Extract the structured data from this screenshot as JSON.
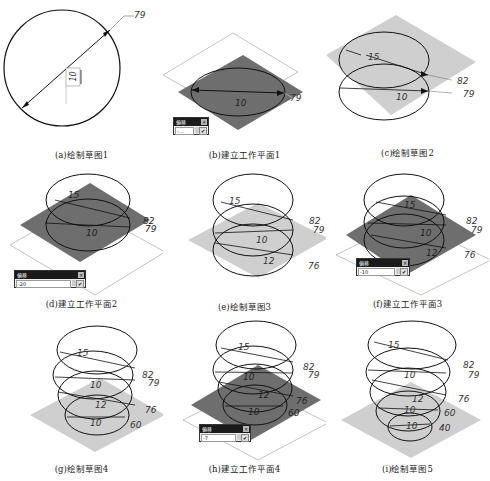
{
  "figure": {
    "panels": [
      {
        "id": "a",
        "caption": "(a)绘制草图1",
        "dims": [
          "79",
          "10"
        ]
      },
      {
        "id": "b",
        "caption": "(b)建立工作平面1",
        "dims": [
          "79",
          "10"
        ],
        "dialog": {
          "title": "偏移",
          "value": "-…"
        }
      },
      {
        "id": "c",
        "caption": "(c)绘制草图2",
        "dims": [
          "15",
          "82",
          "79",
          "10"
        ]
      },
      {
        "id": "d",
        "caption": "(d)建立工作平面2",
        "dims": [
          "15",
          "82",
          "79",
          "10"
        ],
        "dialog": {
          "title": "偏移",
          "value": "-20"
        }
      },
      {
        "id": "e",
        "caption": "(e)绘制草图3",
        "dims": [
          "15",
          "82",
          "79",
          "10",
          "12",
          "76"
        ]
      },
      {
        "id": "f",
        "caption": "(f)建立工作平面3",
        "dims": [
          "15",
          "82",
          "79",
          "10",
          "12",
          "76"
        ],
        "dialog": {
          "title": "偏移",
          "value": "-10"
        }
      },
      {
        "id": "g",
        "caption": "(g)绘制草图4",
        "dims": [
          "15",
          "82",
          "79",
          "10",
          "12",
          "76",
          "10",
          "60"
        ]
      },
      {
        "id": "h",
        "caption": "(h)建立工作平面4",
        "dims": [
          "15",
          "82",
          "79",
          "10",
          "12",
          "76",
          "10",
          "60"
        ],
        "dialog": {
          "title": "偏移",
          "value": "-7"
        }
      },
      {
        "id": "i",
        "caption": "(i)绘制草图5",
        "dims": [
          "15",
          "82",
          "79",
          "10",
          "12",
          "76",
          "10",
          "60",
          "10",
          "40"
        ]
      }
    ],
    "colors": {
      "plane_dark": "#6e6e6e",
      "plane_light": "#cfcfcf",
      "line": "#111111",
      "dialog_title": "#1a1a1a"
    },
    "icons": {
      "dialog_close": "✕",
      "dialog_ok": "✔"
    }
  }
}
